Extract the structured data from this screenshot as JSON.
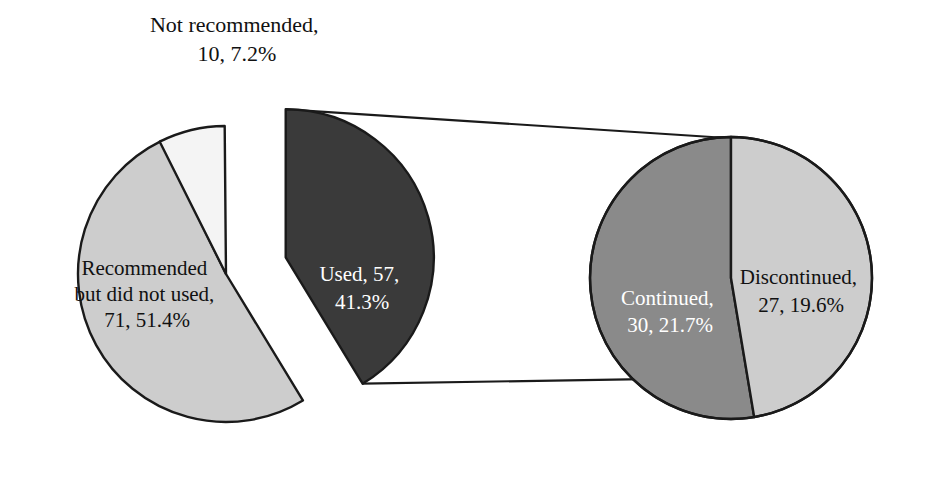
{
  "chart_data": {
    "type": "pie",
    "title": "",
    "subtitle": "",
    "xlabel": "",
    "ylabel": "",
    "legend_position": "none",
    "grid": false,
    "variant": "pie-of-pie",
    "total": 138,
    "primary": {
      "name": "main-pie",
      "categories": [
        "Recommended but did not used",
        "Not recommended",
        "Used"
      ],
      "values": [
        71,
        10,
        57
      ],
      "percents": [
        51.4,
        7.2,
        41.3
      ],
      "colors": [
        "#cdcdcd",
        "#f4f4f4",
        "#3a3a3a"
      ],
      "exploded": [
        "Used"
      ]
    },
    "secondary": {
      "name": "breakout-pie",
      "parent": "Used",
      "categories": [
        "Continued",
        "Discontinued"
      ],
      "values": [
        30,
        27
      ],
      "percents": [
        21.7,
        19.6
      ],
      "colors": [
        "#8a8a8a",
        "#cdcdcd"
      ]
    },
    "labels": {
      "not_recommended": {
        "line1": "Not recommended,",
        "line2": "10, 7.2%"
      },
      "recommended_not_used": {
        "line1": "Recommended",
        "line2": "but did not used,",
        "line3": "71, 51.4%"
      },
      "used": {
        "line1": "Used, 57,",
        "line2": "41.3%"
      },
      "continued": {
        "line1": "Continued,",
        "line2": "30, 21.7%"
      },
      "discontinued": {
        "line1": "Discontinued,",
        "line2": "27, 19.6%"
      }
    },
    "colors": {
      "light_gray": "#cdcdcd",
      "near_white": "#f4f4f4",
      "dark_gray": "#3a3a3a",
      "medium_gray": "#8a8a8a",
      "outline": "#1a1a1a",
      "background": "#ffffff"
    }
  }
}
